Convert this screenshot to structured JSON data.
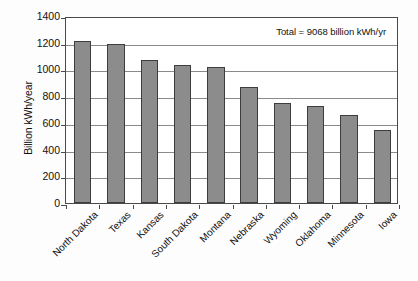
{
  "chart_data": {
    "type": "bar",
    "title": "",
    "xlabel": "",
    "ylabel": "Billion kWh/year",
    "categories": [
      "North Dakota",
      "Texas",
      "Kansas",
      "South Dakota",
      "Montana",
      "Nebraska",
      "Wyoming",
      "Oklahoma",
      "Minnesota",
      "Iowa"
    ],
    "values": [
      1210,
      1190,
      1070,
      1030,
      1020,
      870,
      750,
      725,
      660,
      550
    ],
    "ylim": [
      0,
      1400
    ],
    "ytick_labels": [
      "0",
      "200",
      "400",
      "600",
      "800",
      "1000",
      "1200",
      "1400"
    ],
    "ytick_values": [
      0,
      200,
      400,
      600,
      800,
      1000,
      1200,
      1400
    ],
    "grid": "horizontal",
    "legend": "none",
    "annotations": [
      {
        "text": "Total = 9068 billion kWh/yr",
        "position": "top-right"
      }
    ],
    "bar_color": "#8c8c8c",
    "bar_border_color": "#3d3d3d",
    "plot_background": "#ffffff",
    "frame_color": "#4a4a4a",
    "gridline_color": "#8a8a8a"
  }
}
